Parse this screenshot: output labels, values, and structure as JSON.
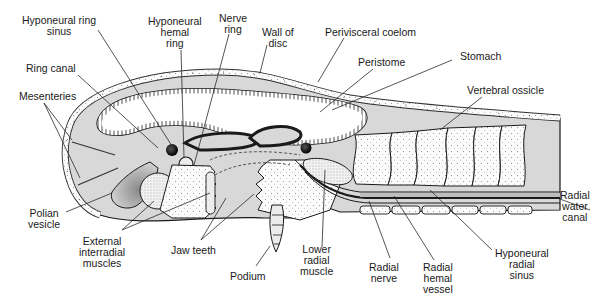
{
  "figure": {
    "type": "cross-section diagram",
    "colors": {
      "coelom_fill": "#d8d8d8",
      "outline": "#1a1a1a",
      "background": "#ffffff",
      "ossicle_fill": "#fafafa"
    }
  },
  "labels": {
    "hyponeural_ring_sinus": "Hyponeural ring\nsinus",
    "hyponeural_hemal_ring": "Hyponeural\nhemal\nring",
    "nerve_ring": "Nerve\nring",
    "wall_of_disc": "Wall of\ndisc",
    "perivisceral_coelom": "Perivisceral coelom",
    "peristome": "Peristome",
    "stomach": "Stomach",
    "ring_canal": "Ring canal",
    "mesenteries": "Mesenteries",
    "vertebral_ossicle": "Vertebral ossicle",
    "radial_water_canal": "Radial\nwater\ncanal",
    "polian_vesicle": "Polian\nvesicle",
    "external_interradial_muscles": "External\ninterradial\nmuscles",
    "jaw_teeth": "Jaw teeth",
    "podium": "Podium",
    "lower_radial_muscle": "Lower\nradial\nmuscle",
    "radial_nerve": "Radial\nnerve",
    "radial_hemal_vessel": "Radial\nhemal\nvessel",
    "hyponeural_radial_sinus": "Hyponeural\nradial\nsinus"
  }
}
